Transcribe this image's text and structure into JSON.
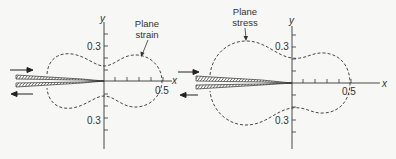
{
  "diagram": {
    "panels": [
      {
        "name": "plane-strain",
        "caption_line1": "Plane",
        "caption_line2": "strain",
        "axis_x_label": "x",
        "axis_y_label": "y",
        "tick_top": "0.3",
        "tick_bottom": "0.3",
        "tick_x": "0.5"
      },
      {
        "name": "plane-stress",
        "caption_line1": "Plane",
        "caption_line2": "stress",
        "axis_x_label": "x",
        "axis_y_label": "y",
        "tick_top": "0.3",
        "tick_bottom": "0.3",
        "tick_x": "0.5"
      }
    ],
    "colors": {
      "line": "#333333",
      "background": "#f7f7f5"
    }
  }
}
